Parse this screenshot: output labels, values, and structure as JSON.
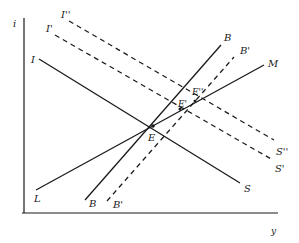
{
  "diagram": {
    "type": "economics-equilibrium-diagram",
    "axes": {
      "y_label": "i",
      "x_label": "y"
    },
    "curves": {
      "IS": {
        "start_label": "I",
        "end_label": "S",
        "style": "solid"
      },
      "IS_prime": {
        "start_label": "I'",
        "end_label": "S'",
        "style": "dashed"
      },
      "IS_double_prime": {
        "start_label": "I''",
        "end_label": "S''",
        "style": "dashed"
      },
      "LM": {
        "start_label": "L",
        "end_label": "M",
        "style": "solid"
      },
      "BB": {
        "start_label": "B",
        "end_label": "B",
        "style": "solid"
      },
      "BB_prime": {
        "start_label": "B'",
        "end_label": "B'",
        "style": "dashed"
      }
    },
    "points": {
      "E": "E",
      "E_prime": "E'",
      "E_double_prime": "E''"
    },
    "colors": {
      "ink": "#1a1a1a",
      "background": "#ffffff"
    }
  }
}
